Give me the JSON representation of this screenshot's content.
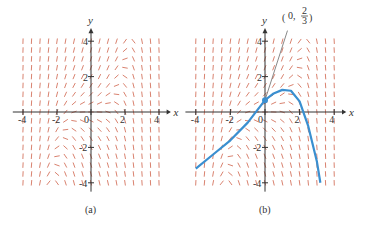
{
  "figure": {
    "panels": [
      {
        "id": "a",
        "caption": "(a)",
        "origin_px": [
          91,
          112
        ],
        "unit_px": [
          17,
          17.7
        ],
        "x_axis_label": "x",
        "y_axis_label": "y",
        "x_ticks": [
          "-4",
          "-2",
          "0",
          "2",
          "4"
        ],
        "y_ticks": [
          "4",
          "2",
          "-2",
          "-4"
        ],
        "has_solution_curve": false
      },
      {
        "id": "b",
        "caption": "(b)",
        "origin_px": [
          265,
          112
        ],
        "unit_px": [
          17.3,
          17.7
        ],
        "x_axis_label": "x",
        "y_axis_label": "y",
        "x_ticks": [
          "-4",
          "-2",
          "0",
          "2",
          "4"
        ],
        "y_ticks": [
          "4",
          "2",
          "-2",
          "-4"
        ],
        "has_solution_curve": true,
        "initial_point_label": "(0, 2/3)",
        "initial_point": [
          0,
          0.667
        ]
      }
    ],
    "colors": {
      "slope_segments": "#d9826f",
      "solution_curve": "#3a8fd0",
      "axes": "#333333"
    }
  },
  "chart_data": {
    "type": "slope_field",
    "panels": [
      "(a) slope field",
      "(b) slope field with solution through (0, 2/3)"
    ],
    "x_range": [
      -4,
      4
    ],
    "y_range": [
      -4,
      4
    ],
    "solution_curve_b": {
      "x": [
        -4,
        -3,
        -2,
        -1,
        0,
        0.5,
        1,
        1.5,
        2,
        2.5,
        3,
        3.2
      ],
      "y": [
        -3.2,
        -2.4,
        -1.6,
        -0.6,
        0.67,
        1.05,
        1.25,
        1.2,
        0.6,
        -0.8,
        -2.8,
        -4
      ]
    },
    "tangent_line_b": {
      "from": [
        0,
        0.67
      ],
      "to": [
        1.3,
        4.6
      ]
    }
  }
}
